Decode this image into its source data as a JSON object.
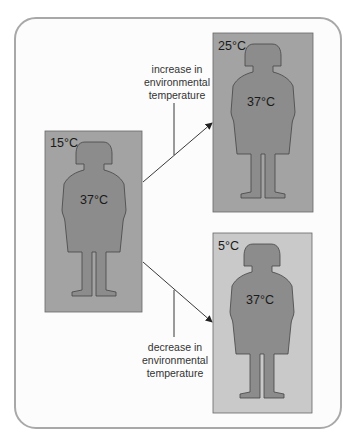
{
  "figure": {
    "panels": [
      {
        "id": "start",
        "ambient": "15°C",
        "body": "37°C",
        "bg": "#a3a3a3"
      },
      {
        "id": "warm",
        "ambient": "25°C",
        "body": "37°C",
        "bg": "#a3a3a3"
      },
      {
        "id": "cold",
        "ambient": "5°C",
        "body": "37°C",
        "bg": "#c9c9c9"
      }
    ],
    "figure_color": "#8c8c8c",
    "arrows": [
      {
        "label_lines": [
          "increase in",
          "environmental",
          "temperature"
        ]
      },
      {
        "label_lines": [
          "decrease in",
          "environmental",
          "temperature"
        ]
      }
    ]
  }
}
